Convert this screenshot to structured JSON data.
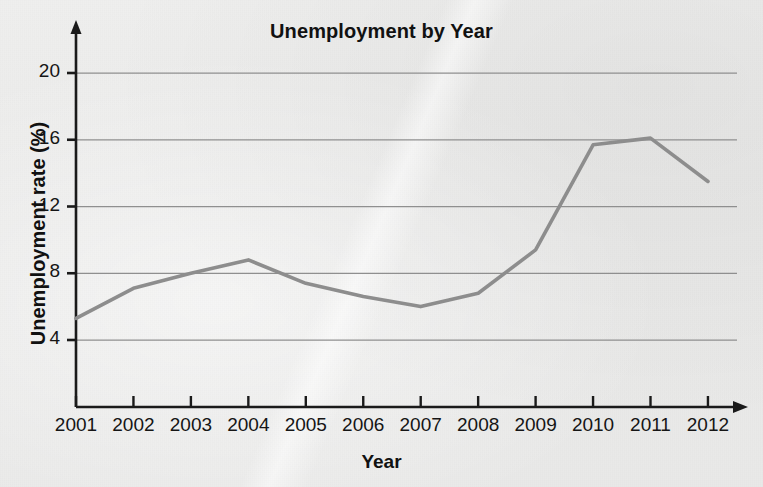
{
  "chart_data": {
    "type": "line",
    "title": "Unemployment by Year",
    "xlabel": "Year",
    "ylabel": "Unemployment rate (%)",
    "x": [
      2001,
      2002,
      2003,
      2004,
      2005,
      2006,
      2007,
      2008,
      2009,
      2010,
      2011,
      2012
    ],
    "xtick_labels": [
      "2001",
      "2002",
      "2003",
      "2004",
      "2005",
      "2006",
      "2007",
      "2008",
      "2009",
      "2010",
      "2011",
      "2012"
    ],
    "values": [
      5.3,
      7.1,
      8.0,
      8.8,
      7.4,
      6.6,
      6.0,
      6.8,
      9.4,
      15.7,
      16.1,
      13.5
    ],
    "ytick_labels": [
      "4",
      "8",
      "12",
      "16",
      "20"
    ],
    "yticks": [
      4,
      8,
      12,
      16,
      20
    ],
    "ylim": [
      0,
      22
    ],
    "xlim": [
      2001,
      2012
    ],
    "grid": "horizontal",
    "legend": "none",
    "series_color": "#8d8d8d",
    "axis_color": "#1a1a1a",
    "grid_color": "#8f8f8f",
    "background_color": "#ebebea"
  }
}
